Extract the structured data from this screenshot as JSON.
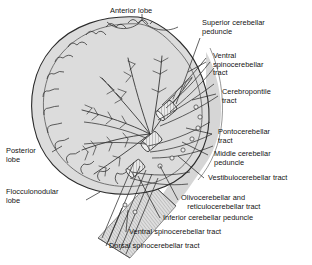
{
  "figure": {
    "colors": {
      "background": "#ffffff",
      "cortex_fill": "#d9d9d9",
      "cortex_fill_light": "#e4e4e4",
      "brainstem_fill": "#cfcfcf",
      "outline": "#2b2b2b",
      "tract_line": "#3a3a3a",
      "leader_line": "#1f1f1f",
      "text": "#131313"
    }
  },
  "labels": {
    "anterior_lobe": "Anterior lobe",
    "superior_cerebellar_peduncle": "Superior cerebellar\npeduncle",
    "ventral_spinocerebellar_tract_right": "Ventral\nspinocerebellar\ntract",
    "cerebropontile_tract": "Cerebropontile\ntract",
    "pontocerebellar_tract": "Pontocerebellar\ntract",
    "middle_cerebellar_peduncle": "Middle cerebellar\npeduncle",
    "vestibulocerebellar_tract": "Vestibulocerebellar tract",
    "olivocerebellar_and_reticulocerebellar_tract": "Olivocerebellar and\n   reticulocerebellar tract",
    "inferior_cerebellar_peduncle": "Inferior cerebellar peduncle",
    "ventral_spinocerebellar_tract_bottom": "Ventral spinocerebellar tract",
    "dorsal_spinocerebellar_tract": "Dorsal spinocerebellar tract",
    "posterior_lobe": "Posterior\nlobe",
    "flocculonodular_lobe": "Flocculonodular\nlobe"
  }
}
